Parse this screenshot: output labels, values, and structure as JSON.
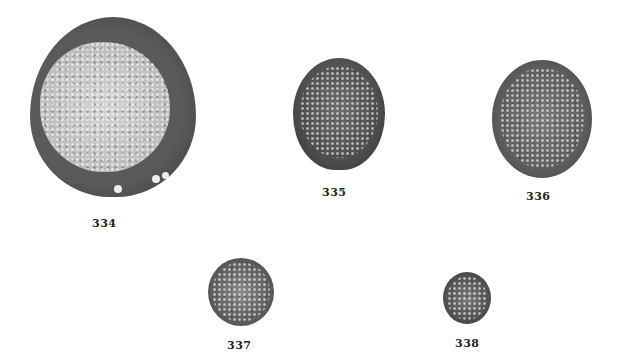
{
  "figure": {
    "specimens": [
      {
        "id": "334",
        "label": "334"
      },
      {
        "id": "335",
        "label": "335"
      },
      {
        "id": "336",
        "label": "336"
      },
      {
        "id": "337",
        "label": "337"
      },
      {
        "id": "338",
        "label": "338"
      }
    ],
    "colors": {
      "background": "#ffffff",
      "outer_wall": "#4a4a4a",
      "inner_light": "#c9c9c9",
      "dark_cell": "#555555"
    }
  }
}
